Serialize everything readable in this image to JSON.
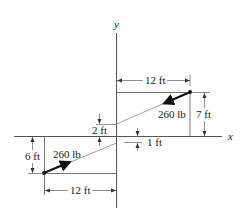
{
  "diagram": {
    "axes": {
      "x_label": "x",
      "y_label": "y"
    },
    "upper_cable": {
      "force_label": "260 lb",
      "horizontal_dim": "12 ft",
      "vertical_dim": "7 ft",
      "offset_dim": "2 ft"
    },
    "lower_cable": {
      "force_label": "260 lb",
      "horizontal_dim": "12 ft",
      "vertical_dim": "6 ft",
      "offset_dim": "1 ft"
    },
    "colors": {
      "line": "#222222",
      "background": "#ffffff"
    }
  }
}
